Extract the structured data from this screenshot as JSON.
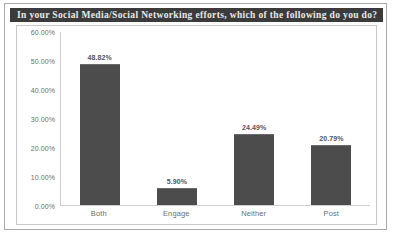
{
  "chart_data": {
    "type": "bar",
    "title": "In your Social Media/Social Networking efforts, which of the following do you do?",
    "xlabel": "",
    "ylabel": "",
    "categories": [
      "Both",
      "Engage",
      "Neither",
      "Post"
    ],
    "values": [
      48.82,
      5.9,
      24.49,
      20.79
    ],
    "value_labels": [
      "48.82%",
      "5.90%",
      "24.49%",
      "20.79%"
    ],
    "ylim": [
      0,
      60
    ],
    "ytick_labels": [
      "0.00%",
      "10.00%",
      "20.00%",
      "30.00%",
      "40.00%",
      "50.00%",
      "60.00%"
    ],
    "ytick_values": [
      0,
      10,
      20,
      30,
      40,
      50,
      60
    ],
    "grid": false,
    "legend": false,
    "bar_color": "#4c4c4c",
    "title_bar_color": "#3b3b3b",
    "title_text_color": "#e9e9e9",
    "axis_color": "#cfcfcf",
    "tick_label_color": "#6d6d6d"
  }
}
